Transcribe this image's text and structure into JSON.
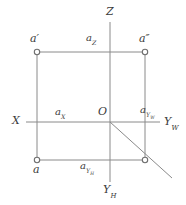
{
  "figure": {
    "type": "descriptive-geometry-projection",
    "title": "",
    "stroke_color": "#8a8a8a",
    "label_color": "#3a3a3a",
    "background": "#ffffff",
    "width": 186,
    "height": 205
  },
  "axes": [
    {
      "id": "z",
      "label": "Z",
      "sub": "",
      "x": 110,
      "y": 13
    },
    {
      "id": "x",
      "label": "X",
      "sub": "",
      "x": 16,
      "y": 122
    },
    {
      "id": "yw",
      "label": "Y",
      "sub": "W",
      "x": 166,
      "y": 124
    },
    {
      "id": "yh",
      "label": "Y",
      "sub": "H",
      "x": 106,
      "y": 192
    }
  ],
  "origin": {
    "label": "O",
    "x": 101,
    "y": 113
  },
  "points": [
    {
      "id": "a-front",
      "label": "a",
      "prime": "′",
      "sub": "",
      "marker_x": 37,
      "marker_y": 52,
      "label_x": 31,
      "label_y": 38
    },
    {
      "id": "a-side",
      "label": "a",
      "prime": "″",
      "sub": "",
      "marker_x": 145,
      "marker_y": 52,
      "label_x": 140,
      "label_y": 38
    },
    {
      "id": "a-top",
      "label": "a",
      "prime": "",
      "sub": "",
      "marker_x": 37,
      "marker_y": 160,
      "label_x": 33,
      "label_y": 167
    },
    {
      "id": "a-corner",
      "label": "",
      "prime": "",
      "sub": "",
      "marker_x": 145,
      "marker_y": 160,
      "label_x": 0,
      "label_y": 0
    }
  ],
  "coordinate_labels": [
    {
      "id": "az",
      "label": "a",
      "sub": "Z",
      "x": 89,
      "y": 38
    },
    {
      "id": "ax",
      "label": "a",
      "sub": "X",
      "x": 57,
      "y": 112
    },
    {
      "id": "ayw",
      "label": "a",
      "sub": "YW",
      "sub_text": "Y",
      "sub_sub": "W",
      "x": 142,
      "y": 110
    },
    {
      "id": "ayh",
      "label": "a",
      "sub": "YH",
      "sub_text": "Y",
      "sub_sub": "H",
      "x": 82,
      "y": 165
    }
  ],
  "geometry": {
    "vertical_axis": {
      "x": 110,
      "y1": 22,
      "y2": 182
    },
    "horizontal_axis": {
      "y": 122,
      "x1": 26,
      "x2": 160
    },
    "rectangle": {
      "left": 37,
      "right": 145,
      "top": 52,
      "bottom": 160
    },
    "diagonal": {
      "x1": 110,
      "y1": 122,
      "x2": 172,
      "y2": 178
    }
  }
}
